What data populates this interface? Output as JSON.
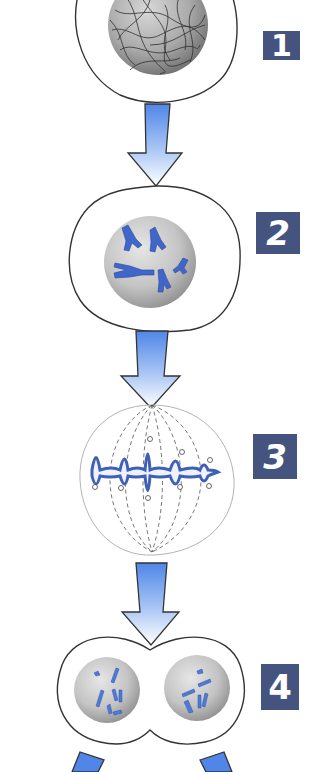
{
  "diagram": {
    "colors": {
      "label_box": "#45547f",
      "label_text": "#ffffff",
      "arrow_top": "#4f86e8",
      "arrow_bottom": "#ffffff",
      "chromosome": "#3f66c8",
      "nucleus": "#bdbdbd",
      "outline": "#333333"
    },
    "stages": [
      {
        "number": "1",
        "name": "Interphase (chromatin in nucleus)"
      },
      {
        "number": "2",
        "name": "Prophase (condensed chromosomes)"
      },
      {
        "number": "3",
        "name": "Metaphase (chromosomes aligned on spindle)"
      },
      {
        "number": "4",
        "name": "Telophase (two daughter nuclei)"
      }
    ],
    "arrows": [
      {
        "from": "1",
        "to": "2"
      },
      {
        "from": "2",
        "to": "3"
      },
      {
        "from": "3",
        "to": "4"
      },
      {
        "from": "4",
        "to": "daughter cells"
      }
    ]
  }
}
